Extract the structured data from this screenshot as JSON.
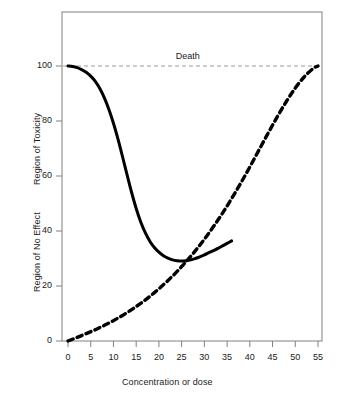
{
  "chart_data": {
    "type": "line",
    "title": "",
    "xlabel": "Concentration or dose",
    "ylabel_upper": "Region of Toxicity",
    "ylabel_lower": "Region of No Effect",
    "xlim": [
      0,
      57
    ],
    "ylim": [
      0,
      107
    ],
    "xticks": [
      0,
      5,
      10,
      15,
      20,
      25,
      30,
      35,
      40,
      45,
      50,
      55
    ],
    "yticks": [
      0,
      20,
      40,
      60,
      80,
      100
    ],
    "grid": false,
    "legend": null,
    "annotations": [
      {
        "text": "Death",
        "x": 27,
        "y": 103
      }
    ],
    "reference_lines": [
      {
        "name": "death-line",
        "orientation": "horizontal",
        "y": 100,
        "style": "dashed",
        "color": "#999999"
      }
    ],
    "series": [
      {
        "name": "no-effect-toxicity-curve",
        "style": "solid",
        "color": "#000000",
        "width": 3,
        "x": [
          0,
          1,
          2,
          3,
          4,
          5,
          6,
          7,
          8,
          9,
          10,
          11,
          12,
          13,
          14,
          15,
          16,
          17,
          18,
          19,
          20,
          21,
          22,
          23,
          24,
          25,
          26,
          27,
          28,
          29,
          30,
          31,
          32,
          33,
          34,
          35,
          36
        ],
        "y": [
          100,
          99.8,
          99.4,
          98.7,
          97.7,
          96.3,
          94.4,
          91.8,
          88.4,
          84.2,
          79.2,
          73.4,
          67.0,
          60.4,
          54.0,
          48.2,
          43.3,
          39.4,
          36.3,
          34.0,
          32.3,
          31.0,
          30.1,
          29.5,
          29.2,
          29.1,
          29.2,
          29.5,
          30.0,
          30.6,
          31.3,
          32.1,
          32.9,
          33.7,
          34.6,
          35.5,
          36.4
        ]
      },
      {
        "name": "dose-response-curve",
        "style": "dashed",
        "color": "#000000",
        "width": 3.4,
        "x": [
          0,
          2,
          4,
          6,
          8,
          10,
          12,
          14,
          16,
          18,
          20,
          22,
          24,
          26,
          28,
          30,
          32,
          34,
          36,
          38,
          40,
          42,
          44,
          46,
          48,
          50,
          52,
          54,
          55
        ],
        "y": [
          0,
          1.3,
          2.7,
          4.1,
          5.7,
          7.4,
          9.3,
          11.4,
          13.7,
          16.2,
          19.0,
          22.0,
          25.3,
          28.9,
          32.8,
          37.0,
          41.6,
          46.5,
          51.8,
          57.4,
          63.3,
          69.4,
          75.5,
          81.4,
          87.0,
          92.0,
          96.1,
          99.2,
          100
        ]
      }
    ]
  },
  "axis": {
    "x_tick_labels": [
      "0",
      "5",
      "10",
      "15",
      "20",
      "25",
      "30",
      "35",
      "40",
      "45",
      "50",
      "55"
    ],
    "y_tick_labels": [
      "0",
      "20",
      "40",
      "60",
      "80",
      "100"
    ],
    "x_title": "Concentration or dose",
    "y_title_upper": "Region of Toxicity",
    "y_title_lower": "Region of No Effect"
  },
  "labels": {
    "death": "Death"
  },
  "colors": {
    "frame": "#808080",
    "curve": "#000000",
    "reference": "#999999",
    "text": "#1a1a1a",
    "background": "#ffffff"
  }
}
